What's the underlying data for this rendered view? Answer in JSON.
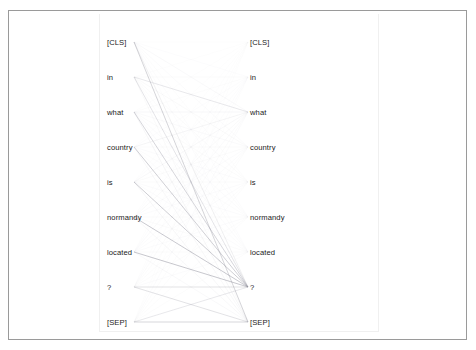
{
  "figure": {
    "type": "attention-head-view",
    "panel": {
      "left": 99,
      "top": 14,
      "width": 280,
      "height": 318,
      "border_color": "#f0f0f0"
    },
    "frame": {
      "left": 8,
      "top": 10,
      "width": 459,
      "height": 330,
      "border_color": "#9a9a9a"
    }
  },
  "tokens": {
    "sequence": [
      "[CLS]",
      "in",
      "what",
      "country",
      "is",
      "normandy",
      "located",
      "?",
      "[SEP]"
    ],
    "left": [
      {
        "label": "[CLS]",
        "x": 107,
        "y": 45
      },
      {
        "label": "in",
        "x": 107,
        "y": 80
      },
      {
        "label": "what",
        "x": 107,
        "y": 115
      },
      {
        "label": "country",
        "x": 107,
        "y": 150
      },
      {
        "label": "is",
        "x": 107,
        "y": 185
      },
      {
        "label": "normandy",
        "x": 107,
        "y": 220
      },
      {
        "label": "located",
        "x": 107,
        "y": 255
      },
      {
        "label": "?",
        "x": 107,
        "y": 290
      },
      {
        "label": "[SEP]",
        "x": 107,
        "y": 325
      }
    ],
    "right": [
      {
        "label": "[CLS]",
        "x": 250,
        "y": 45
      },
      {
        "label": "in",
        "x": 250,
        "y": 80
      },
      {
        "label": "what",
        "x": 250,
        "y": 115
      },
      {
        "label": "country",
        "x": 250,
        "y": 150
      },
      {
        "label": "is",
        "x": 250,
        "y": 185
      },
      {
        "label": "normandy",
        "x": 250,
        "y": 220
      },
      {
        "label": "located",
        "x": 250,
        "y": 255
      },
      {
        "label": "?",
        "x": 250,
        "y": 290
      },
      {
        "label": "[SEP]",
        "x": 250,
        "y": 325
      }
    ]
  },
  "chart_data": {
    "type": "heatmap",
    "title": "",
    "xlabel": "",
    "ylabel": "",
    "rendering": "bipartite attention lines between left (query) and right (key) token columns",
    "line_color": "#8c8c99",
    "line_endpoints": {
      "left_x": 134,
      "right_x": 248,
      "row_ys": [
        42,
        77,
        112,
        147,
        182,
        217,
        252,
        287,
        322
      ]
    },
    "categories": [
      "[CLS]",
      "in",
      "what",
      "country",
      "is",
      "normandy",
      "located",
      "?",
      "[SEP]"
    ],
    "matrix": [
      [
        0.04,
        0.03,
        0.09,
        0.05,
        0.04,
        0.03,
        0.03,
        0.22,
        0.47
      ],
      [
        0.02,
        0.05,
        0.3,
        0.08,
        0.06,
        0.04,
        0.04,
        0.33,
        0.08
      ],
      [
        0.02,
        0.04,
        0.11,
        0.07,
        0.06,
        0.05,
        0.05,
        0.46,
        0.14
      ],
      [
        0.02,
        0.03,
        0.15,
        0.06,
        0.05,
        0.04,
        0.04,
        0.5,
        0.11
      ],
      [
        0.02,
        0.03,
        0.1,
        0.06,
        0.05,
        0.05,
        0.05,
        0.52,
        0.12
      ],
      [
        0.02,
        0.03,
        0.08,
        0.05,
        0.05,
        0.05,
        0.06,
        0.55,
        0.11
      ],
      [
        0.02,
        0.03,
        0.07,
        0.05,
        0.05,
        0.05,
        0.06,
        0.58,
        0.09
      ],
      [
        0.02,
        0.03,
        0.06,
        0.04,
        0.04,
        0.04,
        0.05,
        0.36,
        0.36
      ],
      [
        0.02,
        0.02,
        0.05,
        0.04,
        0.04,
        0.04,
        0.04,
        0.3,
        0.45
      ]
    ],
    "legend_position": "none",
    "grid": false
  }
}
